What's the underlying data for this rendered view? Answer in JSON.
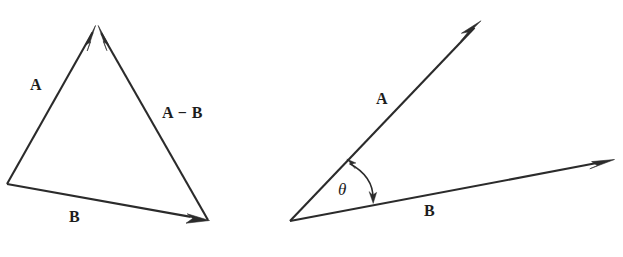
{
  "figure": {
    "width": 623,
    "height": 257,
    "background_color": "#ffffff",
    "ink_color": "#2b2b2b"
  },
  "diagrams": [
    {
      "id": "left-triangle",
      "name": "vector-subtraction-triangle",
      "description": "Triangle showing A, B and the difference vector A minus B",
      "labels": {
        "a": "A",
        "a_minus_b": "A − B",
        "b": "B"
      },
      "vectors": [
        {
          "name": "A",
          "from": [
            7,
            184
          ],
          "to": [
            95,
            27
          ],
          "label": "A"
        },
        {
          "name": "A-B",
          "from": [
            208,
            220
          ],
          "to": [
            98,
            27
          ],
          "label": "A − B"
        },
        {
          "name": "B",
          "from": [
            7,
            184
          ],
          "to": [
            208,
            220
          ],
          "label": "B"
        }
      ]
    },
    {
      "id": "right-angle",
      "name": "angle-between-vectors",
      "description": "Two vectors A and B from a common origin with included angle theta",
      "labels": {
        "a": "A",
        "b": "B",
        "theta": "θ"
      },
      "vectors": [
        {
          "name": "A",
          "from": [
            290,
            221
          ],
          "to": [
            480,
            22
          ],
          "label": "A"
        },
        {
          "name": "B",
          "from": [
            290,
            221
          ],
          "to": [
            613,
            160
          ],
          "label": "B"
        }
      ],
      "angle_arc": {
        "name": "theta-arc",
        "label": "θ",
        "double_headed": true,
        "from": [
          348,
          160
        ],
        "to": [
          374,
          202
        ]
      }
    }
  ]
}
